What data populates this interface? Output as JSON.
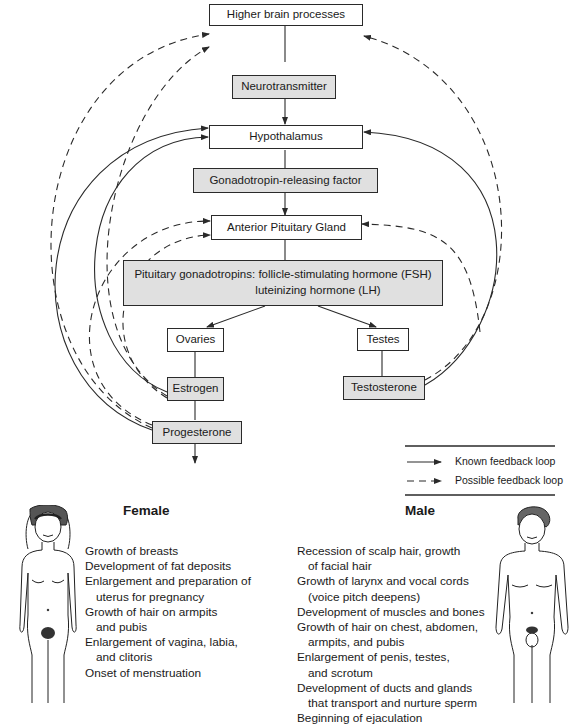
{
  "diagram": {
    "nodes": {
      "higher_brain": "Higher brain processes",
      "neurotransmitter": "Neurotransmitter",
      "hypothalamus": "Hypothalamus",
      "grf": "Gonadotropin-releasing factor",
      "anterior_pituitary": "Anterior Pituitary Gland",
      "gonadotropins_line1": "Pituitary gonadotropins: follicle-stimulating hormone (FSH)",
      "gonadotropins_line2": "luteinizing hormone (LH)",
      "ovaries": "Ovaries",
      "testes": "Testes",
      "estrogen": "Estrogen",
      "testosterone": "Testosterone",
      "progesterone": "Progesterone"
    },
    "legend": {
      "known": "Known feedback loop",
      "possible": "Possible feedback loop"
    },
    "colors": {
      "hormone_fill": "#e0e0e0",
      "organ_fill": "#ffffff",
      "line": "#2a2a2a"
    }
  },
  "female": {
    "heading": "Female",
    "items": [
      {
        "text": "Growth of breasts",
        "indent": false
      },
      {
        "text": "Development of fat deposits",
        "indent": false
      },
      {
        "text": "Enlargement and preparation of",
        "indent": false
      },
      {
        "text": "uterus for pregnancy",
        "indent": true
      },
      {
        "text": "Growth of hair on armpits",
        "indent": false
      },
      {
        "text": "and pubis",
        "indent": true
      },
      {
        "text": "Enlargement of vagina, labia,",
        "indent": false
      },
      {
        "text": "and clitoris",
        "indent": true
      },
      {
        "text": "Onset of menstruation",
        "indent": false
      }
    ]
  },
  "male": {
    "heading": "Male",
    "items": [
      {
        "text": "Recession of scalp hair, growth",
        "indent": false
      },
      {
        "text": "of facial hair",
        "indent": true
      },
      {
        "text": "Growth of larynx and vocal cords",
        "indent": false
      },
      {
        "text": "(voice pitch deepens)",
        "indent": true
      },
      {
        "text": "Development of muscles and bones",
        "indent": false
      },
      {
        "text": "Growth of hair on chest, abdomen,",
        "indent": false
      },
      {
        "text": "armpits, and pubis",
        "indent": true
      },
      {
        "text": "Enlargement of penis, testes,",
        "indent": false
      },
      {
        "text": "and scrotum",
        "indent": true
      },
      {
        "text": "Development of ducts and glands",
        "indent": false
      },
      {
        "text": "that transport and nurture sperm",
        "indent": true
      },
      {
        "text": "Beginning of ejaculation",
        "indent": false
      }
    ]
  }
}
